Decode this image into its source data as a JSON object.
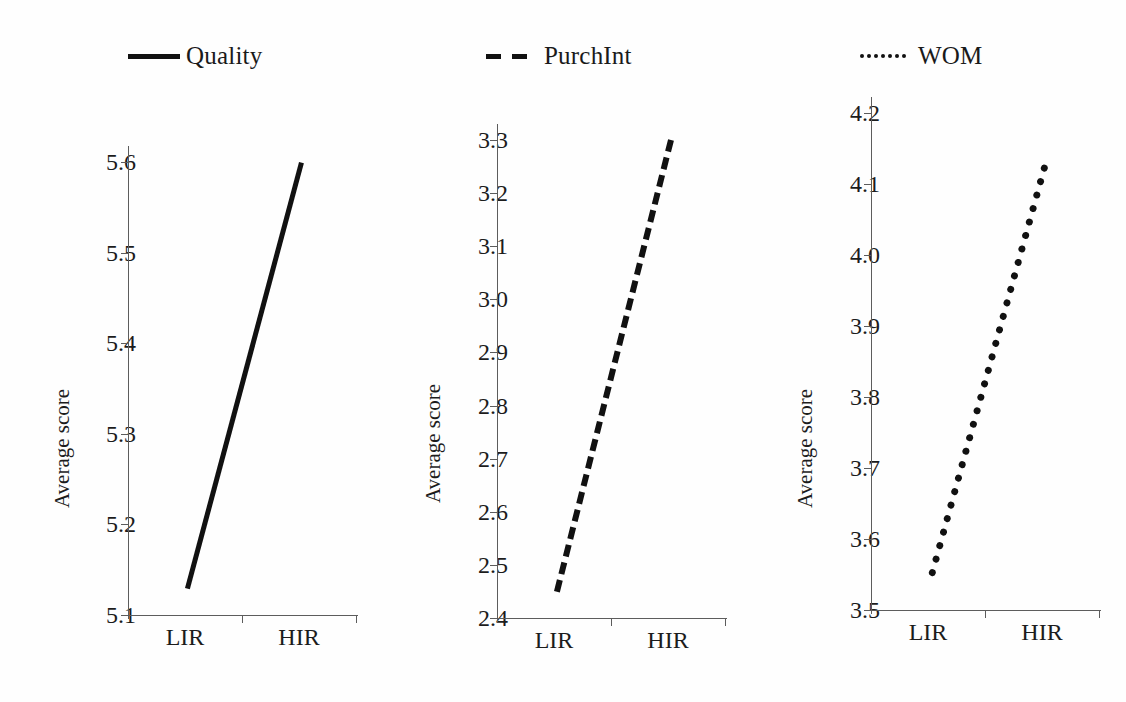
{
  "legend": {
    "items": [
      {
        "label": "Quality",
        "style": "solid",
        "color": "#111111"
      },
      {
        "label": "PurchInt",
        "style": "dashed",
        "color": "#111111"
      },
      {
        "label": "WOM",
        "style": "dotted",
        "color": "#111111"
      }
    ]
  },
  "chart_data": [
    {
      "type": "line",
      "title": "Quality",
      "xlabel": "",
      "ylabel": "Average score",
      "categories": [
        "LIR",
        "HIR"
      ],
      "series": [
        {
          "name": "Quality",
          "values": [
            5.13,
            5.6
          ],
          "style": "solid"
        }
      ],
      "ylim": [
        5.1,
        5.6
      ],
      "yticks": [
        "5.6",
        "5.5",
        "5.4",
        "5.3",
        "5.2",
        "5.1"
      ],
      "ytick_values": [
        5.6,
        5.5,
        5.4,
        5.3,
        5.2,
        5.1
      ],
      "grid": false,
      "legend_position": "top"
    },
    {
      "type": "line",
      "title": "PurchInt",
      "xlabel": "",
      "ylabel": "Average score",
      "categories": [
        "LIR",
        "HIR"
      ],
      "series": [
        {
          "name": "PurchInt",
          "values": [
            2.45,
            3.3
          ],
          "style": "dashed"
        }
      ],
      "ylim": [
        2.4,
        3.3
      ],
      "yticks": [
        "3.3",
        "3.2",
        "3.1",
        "3.0",
        "2.9",
        "2.8",
        "2.7",
        "2.6",
        "2.5",
        "2.4"
      ],
      "ytick_values": [
        3.3,
        3.2,
        3.1,
        3.0,
        2.9,
        2.8,
        2.7,
        2.6,
        2.5,
        2.4
      ],
      "grid": false,
      "legend_position": "top"
    },
    {
      "type": "line",
      "title": "WOM",
      "xlabel": "",
      "ylabel": "Average score",
      "categories": [
        "LIR",
        "HIR"
      ],
      "series": [
        {
          "name": "WOM",
          "values": [
            3.55,
            4.13
          ],
          "style": "dotted"
        }
      ],
      "ylim": [
        3.5,
        4.2
      ],
      "yticks": [
        "4.2",
        "4.1",
        "4.0",
        "3.9",
        "3.8",
        "3.7",
        "3.6",
        "3.5"
      ],
      "ytick_values": [
        4.2,
        4.1,
        4.0,
        3.9,
        3.8,
        3.7,
        3.6,
        3.5
      ],
      "grid": false,
      "legend_position": "top"
    }
  ]
}
